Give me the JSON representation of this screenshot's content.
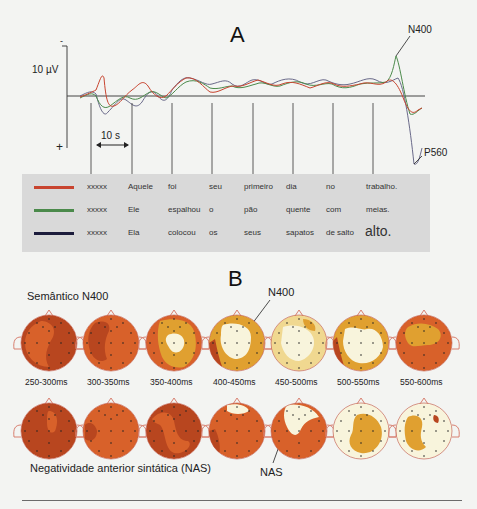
{
  "panels": {
    "a_letter": "A",
    "b_letter": "B"
  },
  "panel_a": {
    "y_axis": {
      "scale_label": "10 µV",
      "minus_label": "-",
      "plus_label": "+"
    },
    "time_scale_label": "10 s",
    "annotations": {
      "n400": "N400",
      "p560": "P560"
    },
    "series": [
      {
        "name": "red",
        "color": "#c8442f"
      },
      {
        "name": "green",
        "color": "#4b8a4b"
      },
      {
        "name": "dark-blue",
        "color": "#2a2a4a"
      }
    ],
    "sentences": [
      {
        "color": "#c8442f",
        "words": [
          "xxxxx",
          "Aquele",
          "foi",
          "seu",
          "primeiro",
          "dia",
          "no",
          "trabalho."
        ]
      },
      {
        "color": "#4b8a4b",
        "words": [
          "xxxxx",
          "Ele",
          "espalhou",
          "o",
          "pão",
          "quente",
          "com",
          "meias."
        ]
      },
      {
        "color": "#1c1c3c",
        "words": [
          "xxxxx",
          "Ela",
          "colocou",
          "os",
          "seus",
          "sapatos",
          "de salto",
          "alto."
        ]
      }
    ]
  },
  "panel_b": {
    "row1_title": "Semântico N400",
    "row2_title": "Negatividade anterior sintática (NAS)",
    "annotation_n400": "N400",
    "annotation_nas": "NAS",
    "time_windows": [
      "250-300ms",
      "300-350ms",
      "350-400ms",
      "400-450ms",
      "450-500ms",
      "500-550ms",
      "550-600ms"
    ],
    "colors": {
      "dark": "#b8461f",
      "mid": "#d8612a",
      "orange": "#e0a030",
      "yellow": "#f0d890",
      "pale": "#f8f4dc"
    }
  }
}
